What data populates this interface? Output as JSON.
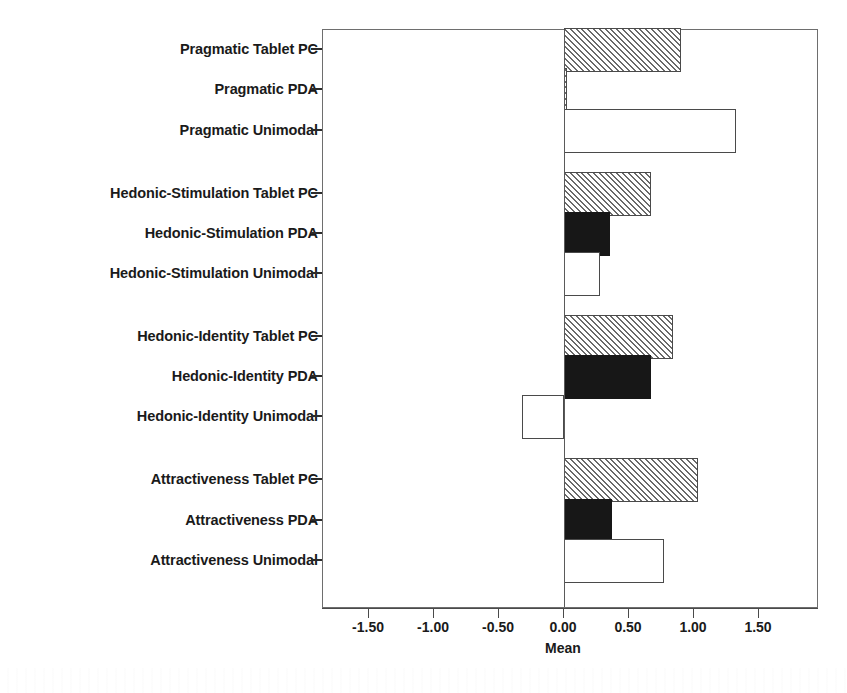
{
  "chart_data": {
    "type": "bar",
    "orientation": "horizontal",
    "title": "",
    "subtitle": "",
    "xlabel": "Mean",
    "ylabel": "",
    "xlim": [
      -1.85,
      1.97
    ],
    "xticks": [
      "-1.50",
      "-1.00",
      "-0.50",
      "0.00",
      "0.50",
      "1.00",
      "1.50"
    ],
    "xtick_values": [
      -1.5,
      -1.0,
      -0.5,
      0.0,
      0.5,
      1.0,
      1.5
    ],
    "grid": false,
    "legend": false,
    "zero_reference_line": true,
    "categories": [
      "Pragmatic Tablet PC",
      "Pragmatic PDA",
      "Pragmatic Unimodal",
      "Hedonic-Stimulation Tablet PC",
      "Hedonic-Stimulation PDA",
      "Hedonic-Stimulation Unimodal",
      "Hedonic-Identity Tablet PC",
      "Hedonic-Identity PDA",
      "Hedonic-Identity Unimodal",
      "Attractiveness Tablet PC",
      "Attractiveness PDA",
      "Attractiveness Unimodal"
    ],
    "values": [
      0.9,
      0.02,
      1.32,
      0.67,
      0.35,
      0.28,
      0.84,
      0.67,
      -0.32,
      1.03,
      0.37,
      0.77
    ],
    "bar_styles": [
      "hatch",
      "hatch",
      "white",
      "hatch",
      "solid",
      "white",
      "hatch",
      "solid",
      "white",
      "hatch",
      "solid",
      "white"
    ],
    "groups": [
      {
        "name": "Pragmatic",
        "categories": [
          "Pragmatic Tablet PC",
          "Pragmatic PDA",
          "Pragmatic Unimodal"
        ]
      },
      {
        "name": "Hedonic-Stimulation",
        "categories": [
          "Hedonic-Stimulation Tablet PC",
          "Hedonic-Stimulation PDA",
          "Hedonic-Stimulation Unimodal"
        ]
      },
      {
        "name": "Hedonic-Identity",
        "categories": [
          "Hedonic-Identity Tablet PC",
          "Hedonic-Identity PDA",
          "Hedonic-Identity Unimodal"
        ]
      },
      {
        "name": "Attractiveness",
        "categories": [
          "Attractiveness Tablet PC",
          "Attractiveness PDA",
          "Attractiveness Unimodal"
        ]
      }
    ],
    "colors": {
      "hatch_line": "#6a6a6a",
      "hatch_background": "#e8e8e8",
      "solid_fill": "#171717",
      "white_fill": "#ffffff",
      "bar_outline": "#4a4a4a",
      "axis": "#4a4a4a",
      "text": "#1a1a1a"
    }
  },
  "axis": {
    "x_title": "Mean"
  }
}
